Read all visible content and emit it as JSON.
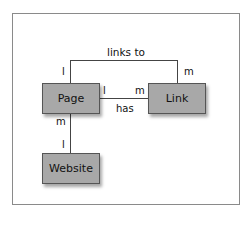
{
  "diagram": {
    "entities": [
      {
        "id": "page",
        "label": "Page"
      },
      {
        "id": "link",
        "label": "Link"
      },
      {
        "id": "website",
        "label": "Website"
      }
    ],
    "relationships": [
      {
        "label": "links to",
        "from": "Page",
        "to": "Link",
        "from_cardinality": "1",
        "to_cardinality": "m"
      },
      {
        "label": "has",
        "from": "Page",
        "to": "Link",
        "from_cardinality": "1",
        "to_cardinality": "m"
      },
      {
        "label": "",
        "from": "Page",
        "to": "Website",
        "from_cardinality": "m",
        "to_cardinality": "1"
      }
    ],
    "labels": {
      "links_to": "links to",
      "has": "has",
      "links_to_page_card": "l",
      "links_to_link_card": "m",
      "has_page_card": "l",
      "has_link_card": "m",
      "website_page_card": "m",
      "website_site_card": "l"
    }
  }
}
